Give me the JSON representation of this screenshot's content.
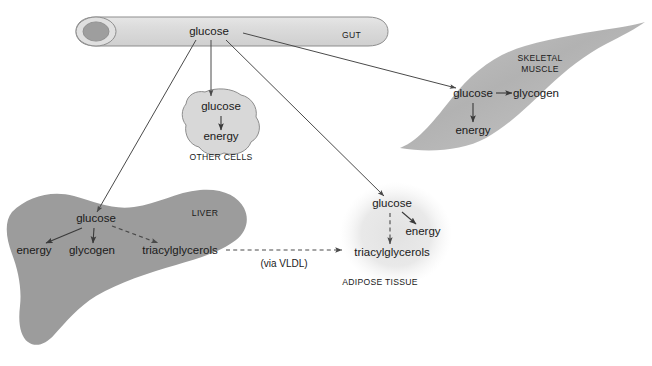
{
  "figure": {
    "background_color": "#ffffff"
  },
  "colors": {
    "gut_fill": "#dcdcdc",
    "gut_lumen": "#9e9e9e",
    "liver_fill": "#9c9c9c",
    "muscle_fill": "#b4b4b4",
    "other_cells_fill": "#d8d8d8",
    "adipose_fill": "#e4e4e4",
    "outline": "#8d8d8d",
    "arrow": "#3a3a3a",
    "text": "#1a1a1a"
  },
  "gut": {
    "organ_label": "GUT",
    "metabolite": "glucose"
  },
  "other_cells": {
    "organ_label": "OTHER CELLS",
    "metabolites": {
      "glucose": "glucose",
      "energy": "energy"
    }
  },
  "skeletal_muscle": {
    "organ_label_line1": "SKELETAL",
    "organ_label_line2": "MUSCLE",
    "metabolites": {
      "glucose": "glucose",
      "glycogen": "glycogen",
      "energy": "energy"
    }
  },
  "liver": {
    "organ_label": "LIVER",
    "metabolites": {
      "glucose": "glucose",
      "energy": "energy",
      "glycogen": "glycogen",
      "triacylglycerols": "triacylglycerols"
    }
  },
  "adipose_tissue": {
    "organ_label": "ADIPOSE TISSUE",
    "metabolites": {
      "glucose": "glucose",
      "energy": "energy",
      "triacylglycerols": "triacylglycerols"
    }
  },
  "transport": {
    "vldl_label": "(via VLDL)"
  }
}
